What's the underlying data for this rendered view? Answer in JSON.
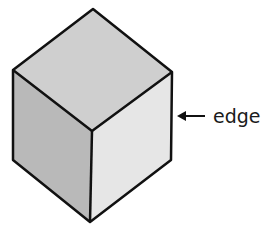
{
  "diagram": {
    "type": "isometric-cube",
    "annotation": {
      "label": "edge",
      "arrow": "left-pointing"
    },
    "faces": {
      "top": {
        "color": "#cfcfcf"
      },
      "left": {
        "color": "#b9b9b9"
      },
      "right": {
        "color": "#e6e6e6"
      }
    },
    "stroke_color": "#111111"
  }
}
